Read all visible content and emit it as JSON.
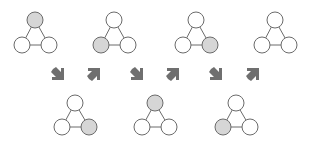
{
  "colors": {
    "filled": "#d6d6d6",
    "empty": "#ffffff",
    "stroke": "#6b6b6b",
    "arrow": "#6f6f6f"
  },
  "diagram": {
    "top_row": [
      {
        "id": "T1",
        "highlighted": "top"
      },
      {
        "id": "T2",
        "highlighted": "bottom-left"
      },
      {
        "id": "T3",
        "highlighted": "bottom-right"
      },
      {
        "id": "T4",
        "highlighted": "none"
      }
    ],
    "bottom_row": [
      {
        "id": "B1",
        "highlighted": "bottom-right"
      },
      {
        "id": "B2",
        "highlighted": "top"
      },
      {
        "id": "B3",
        "highlighted": "bottom-left"
      }
    ],
    "arrows": [
      {
        "direction": "down-right"
      },
      {
        "direction": "up-right"
      },
      {
        "direction": "down-right"
      },
      {
        "direction": "up-right"
      },
      {
        "direction": "down-right"
      },
      {
        "direction": "up-right"
      }
    ]
  }
}
